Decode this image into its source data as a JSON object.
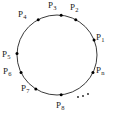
{
  "figure": {
    "type": "circle-with-labeled-points",
    "stroke_color": "#3a3a3a",
    "point_color": "#000000",
    "label_color": "#1a1a1a",
    "background_color": "#ffffff",
    "circle": {
      "center_x": 57,
      "center_y": 55,
      "radius": 40
    },
    "points": [
      {
        "id": "p1",
        "base": "P",
        "sub": "1",
        "angle_deg": 22,
        "dot_x": 94.1,
        "dot_y": 40.0,
        "label_x": 96,
        "label_y": 33
      },
      {
        "id": "p2",
        "base": "P",
        "sub": "2",
        "angle_deg": 62,
        "dot_x": 75.8,
        "dot_y": 19.7,
        "label_x": 70,
        "label_y": 3
      },
      {
        "id": "p3",
        "base": "P",
        "sub": "3",
        "angle_deg": 84,
        "dot_x": 61.2,
        "dot_y": 15.2,
        "label_x": 48,
        "label_y": 1
      },
      {
        "id": "p4",
        "base": "P",
        "sub": "4",
        "angle_deg": 118,
        "dot_x": 38.2,
        "dot_y": 19.7,
        "label_x": 18,
        "label_y": 10
      },
      {
        "id": "p5",
        "base": "P",
        "sub": "5",
        "angle_deg": 178,
        "dot_x": 17.0,
        "dot_y": 53.6,
        "label_x": 2,
        "label_y": 50
      },
      {
        "id": "p6",
        "base": "P",
        "sub": "6",
        "angle_deg": 206,
        "dot_x": 21.0,
        "dot_y": 72.5,
        "label_x": 3,
        "label_y": 67
      },
      {
        "id": "p7",
        "base": "P",
        "sub": "7",
        "angle_deg": 238,
        "dot_x": 35.8,
        "dot_y": 88.9,
        "label_x": 21,
        "label_y": 84
      },
      {
        "id": "p8",
        "base": "P",
        "sub": "8",
        "angle_deg": 276,
        "dot_x": 61.2,
        "dot_y": 94.8,
        "label_x": 56,
        "label_y": 101
      },
      {
        "id": "pn",
        "base": "P",
        "sub": "n",
        "angle_deg": 334,
        "dot_x": 93.0,
        "dot_y": 37.5,
        "label_x": 96,
        "label_y": 66
      }
    ],
    "ellipsis": {
      "label": "...",
      "dots": [
        {
          "x": 78,
          "y": 97
        },
        {
          "x": 83,
          "y": 96
        },
        {
          "x": 88,
          "y": 94
        }
      ]
    }
  }
}
